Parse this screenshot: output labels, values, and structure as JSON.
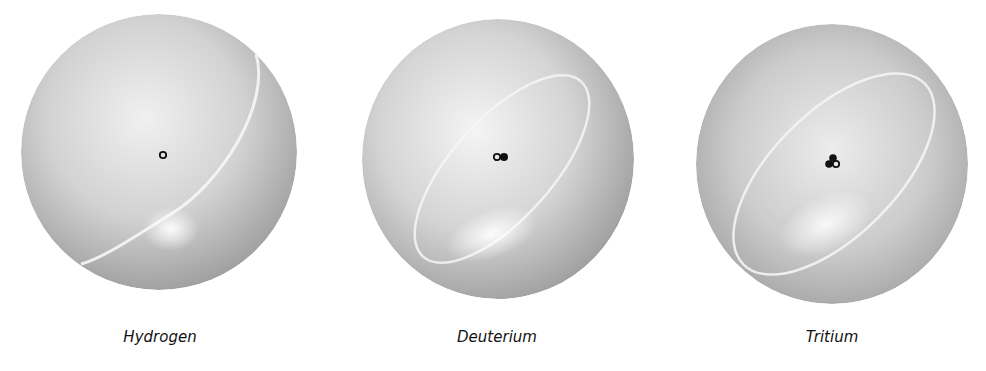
{
  "figure": {
    "atoms": [
      {
        "label": "Hydrogen",
        "nucleus": {
          "protons": 1,
          "neutrons": 0
        }
      },
      {
        "label": "Deuterium",
        "nucleus": {
          "protons": 1,
          "neutrons": 1
        }
      },
      {
        "label": "Tritium",
        "nucleus": {
          "protons": 1,
          "neutrons": 2
        }
      }
    ],
    "colors": {
      "sphere_light": "#f2f2f2",
      "sphere_mid": "#c8c8c8",
      "sphere_dark": "#9a9a9a",
      "nucleon": "#111111",
      "label": "#111111"
    }
  }
}
